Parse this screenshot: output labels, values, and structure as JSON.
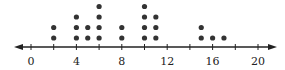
{
  "chart_data": {
    "type": "dot",
    "title": "",
    "xlabel": "",
    "ylabel": "",
    "xlim": [
      -1.3,
      21.5
    ],
    "tick_step": 2,
    "tick_labels": [
      "0",
      "4",
      "8",
      "12",
      "16",
      "20"
    ],
    "tick_label_values": [
      0,
      4,
      8,
      12,
      16,
      20
    ],
    "ticks": [
      0,
      2,
      4,
      6,
      8,
      10,
      12,
      14,
      16,
      18,
      20
    ],
    "points": [
      {
        "x": 2,
        "count": 2
      },
      {
        "x": 4,
        "count": 3
      },
      {
        "x": 5,
        "count": 2
      },
      {
        "x": 6,
        "count": 4
      },
      {
        "x": 8,
        "count": 2
      },
      {
        "x": 10,
        "count": 4
      },
      {
        "x": 11,
        "count": 3
      },
      {
        "x": 15,
        "count": 2
      },
      {
        "x": 16,
        "count": 1
      },
      {
        "x": 17,
        "count": 1
      }
    ],
    "axis_arrows": "both",
    "grid": false,
    "dot_color": "#333333",
    "axis_color": "#222222"
  }
}
